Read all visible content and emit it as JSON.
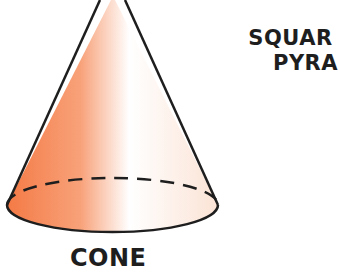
{
  "figure": {
    "shapes": [
      {
        "name": "cone",
        "label": "CONE",
        "fill_gradient": [
          "#f47a45",
          "#f9a983",
          "#ffffff",
          "#fbe0d2"
        ],
        "outline_color": "#1e1e1e",
        "hidden_edge_style": "dashed"
      },
      {
        "name": "square-pyramid",
        "label_line1": "SQUAR",
        "label_line2": "PYRA"
      }
    ]
  }
}
